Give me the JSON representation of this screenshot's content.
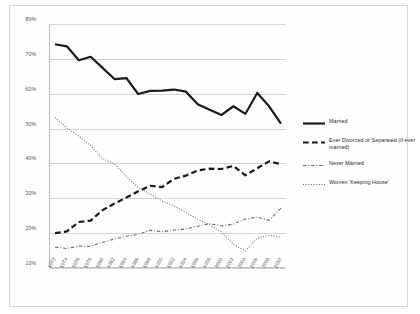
{
  "chart_data": {
    "type": "line",
    "title": "",
    "subtitle": "",
    "xlabel": "",
    "ylabel": "",
    "xlim": [
      1972,
      2010
    ],
    "ylim": [
      10,
      80
    ],
    "ytick_labels": [
      "80%",
      "70%",
      "60%",
      "50%",
      "40%",
      "30%",
      "20%",
      "10%"
    ],
    "ytick_values": [
      80,
      70,
      60,
      50,
      40,
      30,
      20,
      10
    ],
    "grid": "horizontal",
    "legend_position": "right",
    "x": [
      1972,
      1974,
      1976,
      1978,
      1980,
      1982,
      1984,
      1986,
      1988,
      1990,
      1992,
      1994,
      1996,
      1998,
      2000,
      2002,
      2004,
      2006,
      2008,
      2010
    ],
    "categories": [
      "1972",
      "1974",
      "1976",
      "1978",
      "1980",
      "1982",
      "1984",
      "1986",
      "1988",
      "1990",
      "1992",
      "1994",
      "1996",
      "1998",
      "2000",
      "2002",
      "2004",
      "2006",
      "2008",
      "2010"
    ],
    "series": [
      {
        "name": "Married",
        "style": "solid",
        "color": "#1a1a1a",
        "width": 2.2,
        "values": [
          74.2,
          73.6,
          69.6,
          70.6,
          67.4,
          64.2,
          64.5,
          59.9,
          60.8,
          60.9,
          61.2,
          60.6,
          57.0,
          55.4,
          53.9,
          56.4,
          54.2,
          60.2,
          56.4,
          51.4
        ]
      },
      {
        "name": "Ever Divorced or Separated (if ever married)",
        "style": "dashed",
        "color": "#1a1a1a",
        "width": 2.2,
        "values": [
          20.0,
          20.5,
          23.2,
          23.6,
          26.6,
          28.5,
          30.2,
          32.0,
          33.6,
          33.2,
          35.6,
          36.5,
          38.0,
          38.5,
          38.4,
          39.3,
          36.6,
          38.6,
          40.6,
          39.8
        ]
      },
      {
        "name": "Never Married",
        "style": "dashdot",
        "color": "#6e6e6e",
        "width": 1.1,
        "values": [
          16.0,
          15.6,
          16.3,
          16.2,
          17.4,
          18.3,
          19.1,
          19.7,
          20.8,
          20.4,
          20.9,
          21.2,
          22.0,
          22.7,
          22.1,
          22.6,
          24.0,
          24.6,
          23.7,
          27.2
        ]
      },
      {
        "name": "Women 'Keeping House'",
        "style": "dotted",
        "color": "#6e6e6e",
        "width": 1.1,
        "values": [
          53.2,
          50.2,
          47.8,
          45.1,
          41.3,
          39.9,
          36.3,
          33.0,
          31.3,
          29.2,
          27.8,
          26.0,
          24.0,
          22.4,
          20.3,
          16.8,
          14.9,
          18.6,
          19.4,
          18.8
        ]
      }
    ]
  },
  "legend": {
    "items": [
      {
        "label": "Married",
        "key": "solid-thick-line-key"
      },
      {
        "label": "Ever Divorced or Separated (if ever married)",
        "key": "dashed-thick-line-key"
      },
      {
        "label": "Never Married",
        "key": "dashdot-thin-line-key"
      },
      {
        "label": "Women 'Keeping House'",
        "key": "dotted-thin-line-key"
      }
    ]
  }
}
